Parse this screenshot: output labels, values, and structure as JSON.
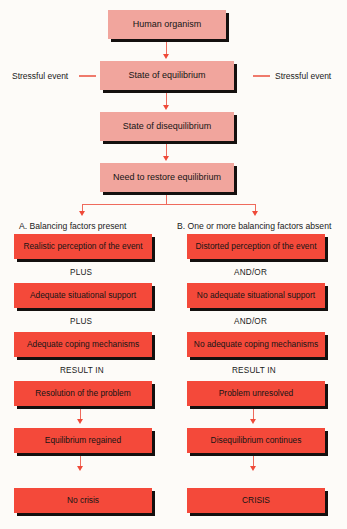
{
  "diagram": {
    "colors": {
      "background": "#fdfbf8",
      "pink_box": "#f1a59d",
      "red_box": "#f4493a",
      "shadow": "#14100f",
      "connector": "#ef6a5c",
      "text": "#151515"
    },
    "top_chain": [
      {
        "label": "Human organism"
      },
      {
        "label": "State of equilibrium"
      },
      {
        "label": "State of disequilibrium"
      },
      {
        "label": "Need to restore equilibrium"
      }
    ],
    "side_labels": {
      "left": "Stressful event",
      "right": "Stressful event"
    },
    "branches": [
      {
        "heading": "A. Balancing factors present",
        "steps": [
          "Realistic perception of the event",
          "Adequate situational support",
          "Adequate coping mechanisms"
        ],
        "connectors": [
          "PLUS",
          "PLUS"
        ],
        "result_label": "RESULT IN",
        "outcomes": [
          "Resolution of the problem",
          "Equilibrium regained",
          "No crisis"
        ]
      },
      {
        "heading": "B. One or more balancing factors absent",
        "steps": [
          "Distorted perception of the event",
          "No adequate situational support",
          "No adequate coping mechanisms"
        ],
        "connectors": [
          "AND/OR",
          "AND/OR"
        ],
        "result_label": "RESULT IN",
        "outcomes": [
          "Problem unresolved",
          "Disequilibrium continues",
          "CRISIS"
        ]
      }
    ]
  }
}
